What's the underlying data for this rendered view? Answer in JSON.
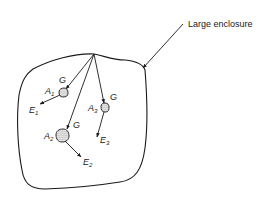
{
  "diagram": {
    "callout": {
      "label": "Large enclosure"
    },
    "bodies": [
      {
        "id": "A1",
        "area_label": "A",
        "area_sub": "1",
        "irradiation_label": "G",
        "emission_label": "E",
        "emission_sub": "1"
      },
      {
        "id": "A2",
        "area_label": "A",
        "area_sub": "2",
        "irradiation_label": "G",
        "emission_label": "E",
        "emission_sub": "2"
      },
      {
        "id": "A3",
        "area_label": "A",
        "area_sub": "3",
        "irradiation_label": "G",
        "emission_label": "E",
        "emission_sub": "3"
      }
    ],
    "colors": {
      "stroke": "#1a1a1a",
      "background": "#ffffff",
      "body_fill": "#d8d8d8"
    }
  }
}
